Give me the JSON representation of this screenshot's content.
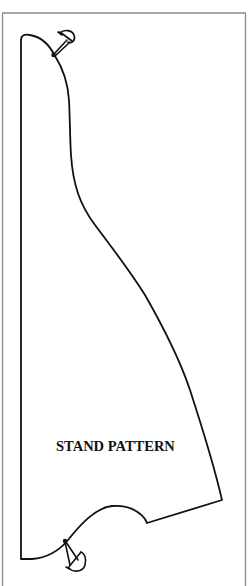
{
  "diagram": {
    "title": "STAND PATTERN",
    "colors": {
      "background": "#ffffff",
      "outline": "#111111",
      "frame": "#777777"
    },
    "shape": {
      "name": "stand-pattern-piece",
      "left_edge": "straight vertical",
      "top_edge": "rounded curve",
      "right_edge": "S-curve descending to a corner",
      "bottom_edge": "straight segment then wave curve"
    },
    "markers": [
      {
        "name": "pin-top",
        "position": "upper curve"
      },
      {
        "name": "pin-bottom",
        "position": "lower curve"
      }
    ]
  }
}
